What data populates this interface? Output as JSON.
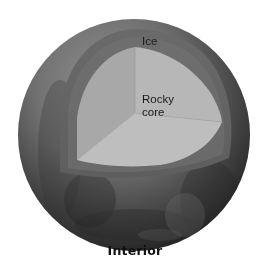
{
  "diagram": {
    "title": "Interior",
    "labels": {
      "ice": "Ice",
      "core": "Rocky core"
    },
    "label_lines": {
      "core_line1": "Rocky",
      "core_line2": "core"
    },
    "layers": [
      {
        "name": "Ice",
        "color": "#6e6e6e"
      },
      {
        "name": "Rocky core",
        "color": "#a9a9a9"
      }
    ],
    "colors": {
      "background": "#ffffff",
      "surface_dark": "#2a2a2a",
      "surface_mid": "#5c5c5c",
      "surface_light": "#9a9a9a",
      "ice_band": "#6a6a6a",
      "ice_band_light": "#7c7c7c",
      "core_top_face": "#b4b4b4",
      "core_left_face": "#a6a6a6",
      "core_bottom_face": "#bdbdbd",
      "text": "#1a1a1a"
    }
  }
}
